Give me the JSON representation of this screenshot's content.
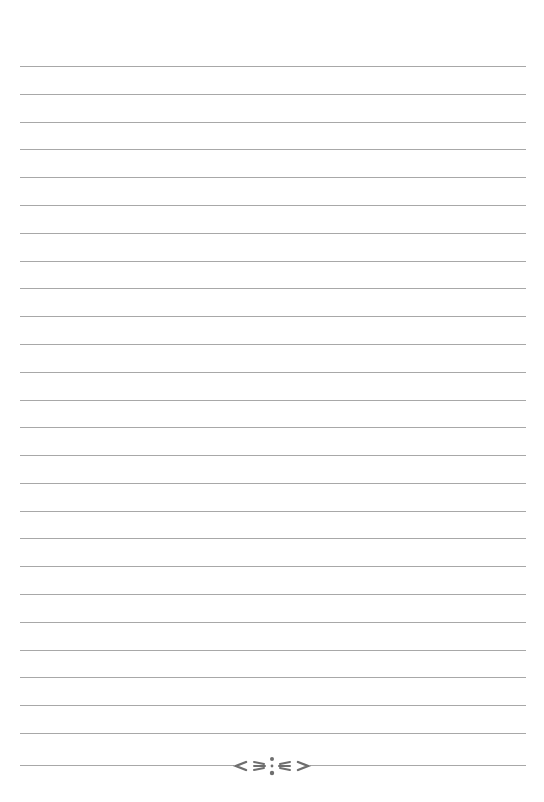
{
  "page": {
    "type": "lined-paper",
    "background": "#ffffff",
    "line_color": "#a8a8a8",
    "line_count": 25,
    "first_line_y": 66,
    "last_line_y": 733,
    "line_left_x": 20,
    "line_right_x": 526
  },
  "footer": {
    "ornament": "floral-divider-icon",
    "ornament_color": "#6e6e6e",
    "line_y": 765
  }
}
